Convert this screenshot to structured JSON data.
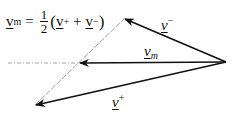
{
  "formula": {
    "lhs": "v",
    "lhs_sub": "m",
    "equals": "=",
    "frac_num": "1",
    "frac_den": "2",
    "open_paren": "(",
    "term1": "v",
    "term1_sup": "+",
    "plus": "+",
    "term2": "v",
    "term2_sup": "−",
    "close_paren": ")"
  },
  "labels": {
    "v_minus": {
      "base": "v",
      "sup": "−"
    },
    "v_m": {
      "base": "v",
      "sub": "m"
    },
    "v_plus": {
      "base": "v",
      "sup": "+"
    }
  },
  "colors": {
    "stroke": "#111111",
    "guide": "#888888"
  }
}
